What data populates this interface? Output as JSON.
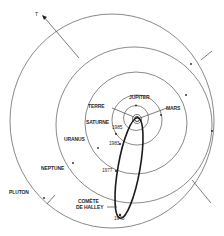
{
  "diagram": {
    "title": "",
    "colors": {
      "orbit": "#6b6b6b",
      "comet": "#1a1a1a",
      "background": "#ffffff"
    },
    "direction_marker": "T",
    "planets": [
      {
        "id": "terre",
        "label": "TERRE"
      },
      {
        "id": "jupiter",
        "label": "JUPITER"
      },
      {
        "id": "mars",
        "label": "MARS"
      },
      {
        "id": "saturne",
        "label": "SATURNE"
      },
      {
        "id": "uranus",
        "label": "URANUS"
      },
      {
        "id": "neptune",
        "label": "NEPTUNE"
      },
      {
        "id": "pluton",
        "label": "PLUTON"
      }
    ],
    "comet": {
      "label_line1": "COMÈTE",
      "label_line2": "DE HALLEY"
    },
    "years": [
      "1985",
      "1983",
      "1977",
      "1948"
    ]
  }
}
